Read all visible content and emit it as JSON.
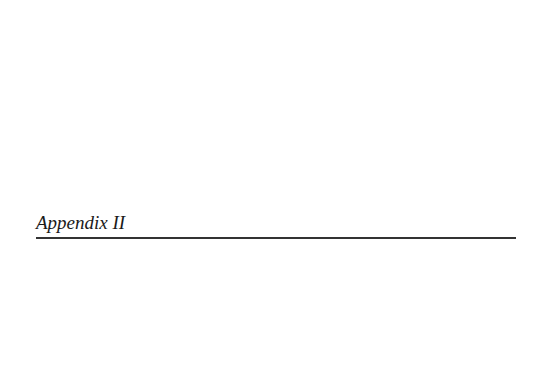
{
  "page": {
    "heading": "Appendix II"
  }
}
